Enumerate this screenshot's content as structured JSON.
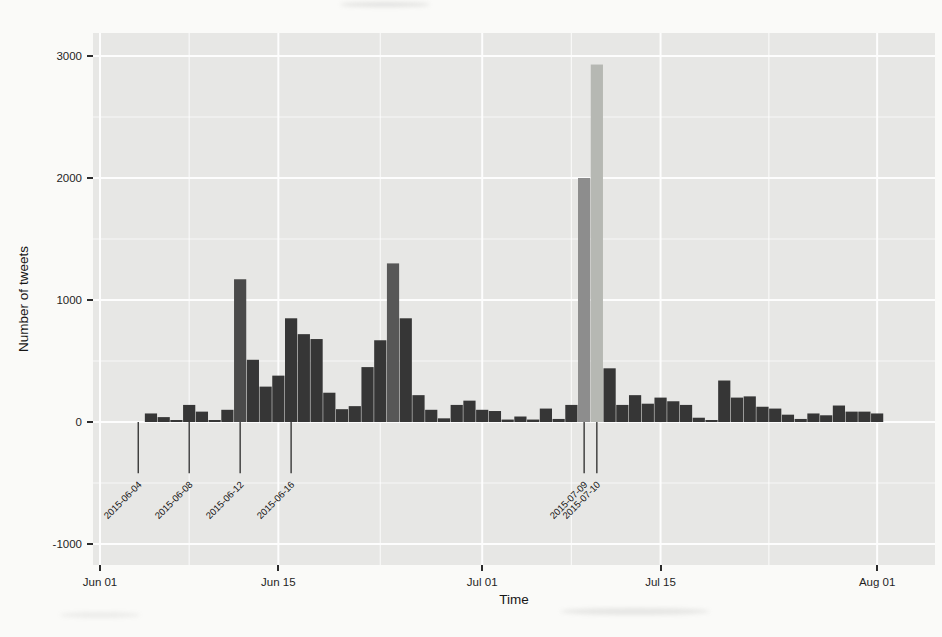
{
  "figure": {
    "background": "#fafaf8",
    "panel_background": "#e7e7e5",
    "grid_major_color": "#fdfdfd",
    "grid_minor_color": "rgba(255,255,255,0.72)",
    "bar_color": "#363636",
    "annotation_line_color": "#1a1a1a",
    "annotation_text_color": "#141414",
    "tick_color": "#2b2b2b"
  },
  "chart_data": {
    "type": "bar",
    "title": "",
    "xlabel": "Time",
    "ylabel": "Number of tweets",
    "x_tick_labels": [
      "Jun 01",
      "Jun 15",
      "Jul 01",
      "Jul 15",
      "Aug 01"
    ],
    "x_tick_dates": [
      "2015-06-01",
      "2015-06-15",
      "2015-07-01",
      "2015-07-15",
      "2015-08-01"
    ],
    "y_ticks": [
      3000,
      2000,
      1000,
      0,
      -1000
    ],
    "ylim": [
      -1175,
      3190
    ],
    "grid": "major-and-minor",
    "legend": "none",
    "series": [
      [
        "2015-06-01",
        0
      ],
      [
        "2015-06-02",
        0
      ],
      [
        "2015-06-03",
        0
      ],
      [
        "2015-06-04",
        0
      ],
      [
        "2015-06-05",
        70
      ],
      [
        "2015-06-06",
        40
      ],
      [
        "2015-06-07",
        10
      ],
      [
        "2015-06-08",
        140
      ],
      [
        "2015-06-09",
        85
      ],
      [
        "2015-06-10",
        15
      ],
      [
        "2015-06-11",
        100
      ],
      [
        "2015-06-12",
        1170
      ],
      [
        "2015-06-13",
        510
      ],
      [
        "2015-06-14",
        290
      ],
      [
        "2015-06-15",
        380
      ],
      [
        "2015-06-16",
        850
      ],
      [
        "2015-06-17",
        720
      ],
      [
        "2015-06-18",
        680
      ],
      [
        "2015-06-19",
        240
      ],
      [
        "2015-06-20",
        105
      ],
      [
        "2015-06-21",
        130
      ],
      [
        "2015-06-22",
        450
      ],
      [
        "2015-06-23",
        670
      ],
      [
        "2015-06-24",
        1300
      ],
      [
        "2015-06-25",
        850
      ],
      [
        "2015-06-26",
        220
      ],
      [
        "2015-06-27",
        100
      ],
      [
        "2015-06-28",
        30
      ],
      [
        "2015-06-29",
        140
      ],
      [
        "2015-06-30",
        175
      ],
      [
        "2015-07-01",
        100
      ],
      [
        "2015-07-02",
        90
      ],
      [
        "2015-07-03",
        20
      ],
      [
        "2015-07-04",
        45
      ],
      [
        "2015-07-05",
        20
      ],
      [
        "2015-07-06",
        110
      ],
      [
        "2015-07-07",
        25
      ],
      [
        "2015-07-08",
        140
      ],
      [
        "2015-07-09",
        2000
      ],
      [
        "2015-07-10",
        2930
      ],
      [
        "2015-07-11",
        440
      ],
      [
        "2015-07-12",
        140
      ],
      [
        "2015-07-13",
        220
      ],
      [
        "2015-07-14",
        150
      ],
      [
        "2015-07-15",
        200
      ],
      [
        "2015-07-16",
        170
      ],
      [
        "2015-07-17",
        140
      ],
      [
        "2015-07-18",
        35
      ],
      [
        "2015-07-19",
        10
      ],
      [
        "2015-07-20",
        340
      ],
      [
        "2015-07-21",
        200
      ],
      [
        "2015-07-22",
        210
      ],
      [
        "2015-07-23",
        125
      ],
      [
        "2015-07-24",
        110
      ],
      [
        "2015-07-25",
        60
      ],
      [
        "2015-07-26",
        25
      ],
      [
        "2015-07-27",
        70
      ],
      [
        "2015-07-28",
        55
      ],
      [
        "2015-07-29",
        135
      ],
      [
        "2015-07-30",
        85
      ],
      [
        "2015-07-31",
        85
      ],
      [
        "2015-08-01",
        70
      ]
    ],
    "highlighted_bars": {
      "2015-06-12": "#4a4a4a",
      "2015-06-24": "#575757",
      "2015-07-09": "#8d8d8d",
      "2015-07-10": "#b6b8b3"
    },
    "annotations": {
      "labels": [
        "2015-06-04",
        "2015-06-08",
        "2015-06-12",
        "2015-06-16",
        "2015-07-09",
        "2015-07-10"
      ],
      "segment_value_from": 0,
      "segment_value_to": -420,
      "label_angle_deg": 45
    }
  }
}
